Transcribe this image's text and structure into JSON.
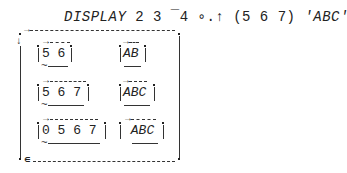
{
  "command": {
    "keyword": "DISPLAY",
    "args": "2 3 ¯4 ∘.↑ (5 6 7) ",
    "string_literal": "'ABC'"
  },
  "outer_box": {
    "markers": {
      "right_arrow": "→",
      "down_arrow": "↓",
      "nested_marker": "∊"
    }
  },
  "rows": [
    {
      "numeric": "5 6",
      "character": "AB"
    },
    {
      "numeric": "5 6 7",
      "character": "ABC"
    },
    {
      "numeric": "0 5 6 7",
      "character": " ABC"
    }
  ],
  "glyphs": {
    "tilde": "~",
    "right_arrow": "→",
    "epsilon": "∊"
  }
}
